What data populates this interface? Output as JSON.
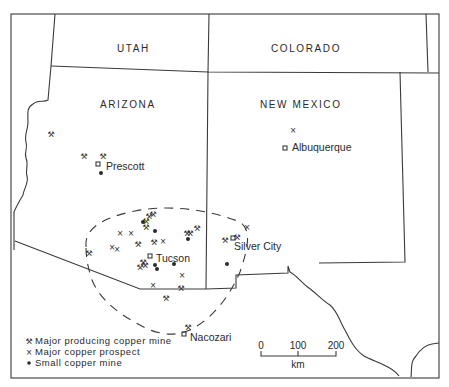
{
  "states": {
    "utah": "UTAH",
    "colorado": "COLORADO",
    "arizona": "ARIZONA",
    "new_mexico": "NEW MEXICO"
  },
  "cities": {
    "prescott": "Prescott",
    "albuquerque": "Albuquerque",
    "tucson": "Tucson",
    "silver_city": "Silver City",
    "nacozari": "Nacozari"
  },
  "legend": {
    "items": [
      {
        "symbol": "crossed-hammers",
        "label": "Major producing copper mine"
      },
      {
        "symbol": "x-mark",
        "label": "Major copper prospect"
      },
      {
        "symbol": "filled-dot",
        "label": "Small copper mine"
      }
    ]
  },
  "scale_bar": {
    "ticks": [
      "0",
      "100",
      "200"
    ],
    "unit": "km"
  },
  "symbols": {
    "mine": "⚒",
    "prospect": "×",
    "small": "●",
    "city": "□"
  },
  "colors": {
    "ink": "#2a2a2a",
    "background": "#ffffff"
  }
}
